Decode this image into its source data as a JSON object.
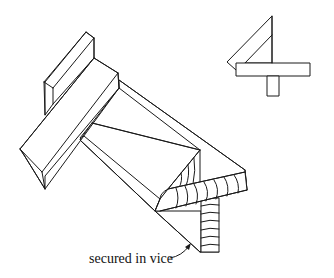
{
  "figure": {
    "type": "technical-line-drawing",
    "labels": {
      "vice": "secured in vice"
    },
    "colors": {
      "line": "#1a1a1a",
      "background": "#ffffff"
    }
  }
}
